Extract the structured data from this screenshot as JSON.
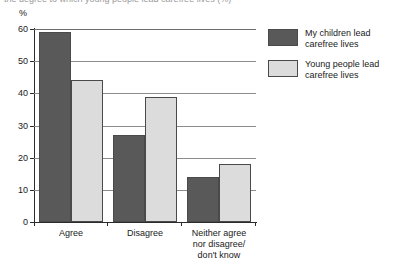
{
  "title_sliver": "the degree to which young people lead carefree lives (%)",
  "axis": {
    "unit_label": "%",
    "y_ticks": [
      "0",
      "10",
      "20",
      "30",
      "40",
      "50",
      "60"
    ]
  },
  "legend": {
    "items": [
      {
        "label_line1": "My children lead",
        "label_line2": "carefree lives",
        "color": "#595959"
      },
      {
        "label_line1": "Young people lead",
        "label_line2": "carefree lives",
        "color": "#dcdcdc"
      }
    ]
  },
  "categories_wrapped": [
    [
      "Agree"
    ],
    [
      "Disagree"
    ],
    [
      "Neither agree",
      "nor disagree/",
      "don't know"
    ]
  ],
  "chart_data": {
    "type": "bar",
    "title": "",
    "xlabel": "",
    "ylabel": "%",
    "ylim": [
      0,
      60
    ],
    "ytick_step": 10,
    "grid": true,
    "legend_position": "right",
    "categories": [
      "Agree",
      "Disagree",
      "Neither agree nor disagree/don't know"
    ],
    "series": [
      {
        "name": "My children lead carefree lives",
        "color": "#595959",
        "values": [
          59,
          27,
          14
        ]
      },
      {
        "name": "Young people lead carefree lives",
        "color": "#dcdcdc",
        "values": [
          44,
          39,
          18
        ]
      }
    ]
  }
}
